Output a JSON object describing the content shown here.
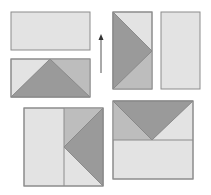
{
  "colors": {
    "light": "#e3e3e3",
    "medium": "#bdbdbd",
    "dark": "#9a9a9a",
    "stroke": "#8c8c8c",
    "arrow": "#555555",
    "background": "#ffffff"
  },
  "shapes": [
    {
      "id": "top-left-plain-rectangle",
      "kind": "rectangle",
      "orientation": "horizontal"
    },
    {
      "id": "top-left-triangle-rectangle",
      "kind": "rectangle-with-triangle",
      "orientation": "horizontal",
      "triangle_apex": "top-center"
    },
    {
      "id": "top-middle-triangle-rectangle",
      "kind": "rectangle-with-triangle",
      "orientation": "vertical",
      "triangle_apex": "right-center"
    },
    {
      "id": "top-right-plain-rectangle",
      "kind": "rectangle",
      "orientation": "vertical"
    },
    {
      "id": "bottom-left-combined-square",
      "kind": "square-combined",
      "triangle_apex": "left-center-of-right-half"
    },
    {
      "id": "bottom-right-combined-square",
      "kind": "square-combined",
      "triangle_apex": "bottom-center-of-top-half"
    }
  ],
  "arrow": {
    "direction": "up"
  }
}
